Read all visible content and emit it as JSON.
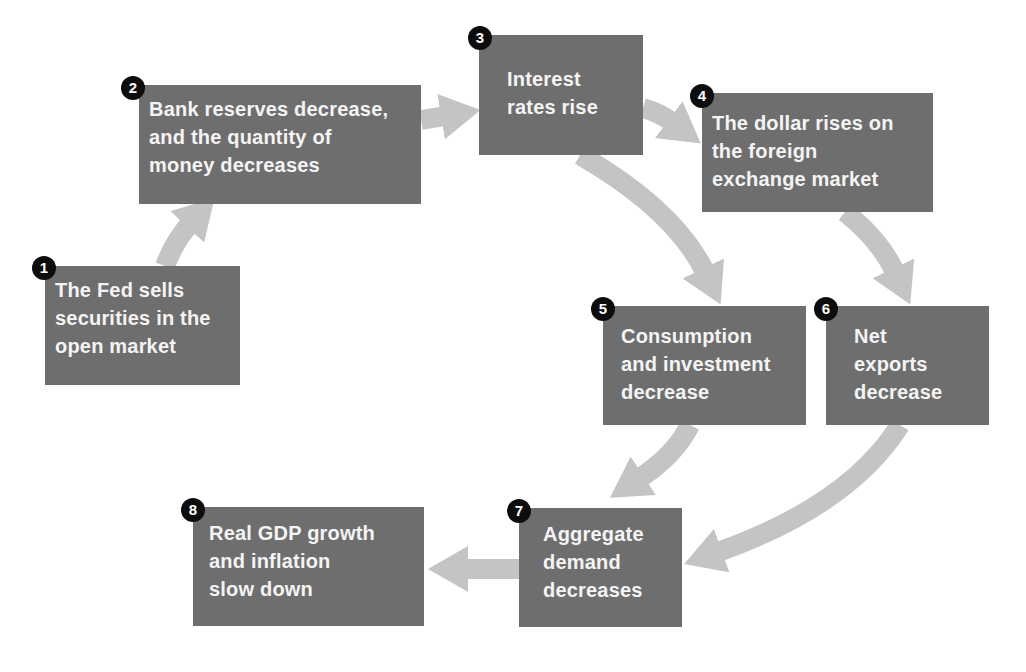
{
  "diagram": {
    "colors": {
      "box_fill": "#6e6e6e",
      "box_text": "#f4f4f4",
      "arrow": "#c4c4c4",
      "badge_fill": "#0d0d0d",
      "badge_text": "#ffffff",
      "background": "#ffffff"
    },
    "steps": [
      {
        "number": "1",
        "lines": [
          "The Fed sells",
          "securities in the",
          "open market"
        ]
      },
      {
        "number": "2",
        "lines": [
          "Bank reserves decrease,",
          "and the quantity of",
          "money decreases"
        ]
      },
      {
        "number": "3",
        "lines": [
          "Interest",
          "rates rise"
        ]
      },
      {
        "number": "4",
        "lines": [
          "The dollar rises on",
          "the foreign",
          "exchange market"
        ]
      },
      {
        "number": "5",
        "lines": [
          "Consumption",
          "and investment",
          "decrease"
        ]
      },
      {
        "number": "6",
        "lines": [
          "Net",
          "exports",
          "decrease"
        ]
      },
      {
        "number": "7",
        "lines": [
          "Aggregate",
          "demand",
          "decreases"
        ]
      },
      {
        "number": "8",
        "lines": [
          "Real GDP growth",
          "and inflation",
          "slow down"
        ]
      }
    ],
    "arrows": [
      {
        "from": "1",
        "to": "2"
      },
      {
        "from": "2",
        "to": "3"
      },
      {
        "from": "3",
        "to": "4"
      },
      {
        "from": "3",
        "to": "5"
      },
      {
        "from": "4",
        "to": "6"
      },
      {
        "from": "5",
        "to": "7"
      },
      {
        "from": "6",
        "to": "7"
      },
      {
        "from": "7",
        "to": "8"
      }
    ]
  }
}
